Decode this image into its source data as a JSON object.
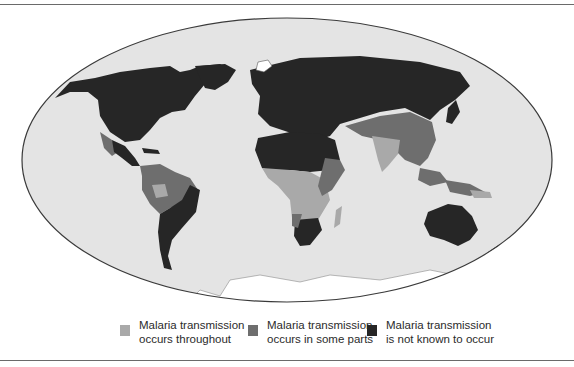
{
  "map": {
    "projection": "elliptical world map",
    "colors": {
      "ocean": "#e4e4e4",
      "throughout": "#a9a9a9",
      "some_parts": "#6e6e6e",
      "not_known": "#262626",
      "ice": "#ffffff",
      "outline": "#3a3a3a",
      "rule": "#6a6a6a"
    }
  },
  "legend": {
    "items": [
      {
        "line1": "Malaria transmission",
        "line2": "occurs throughout",
        "color": "#a9a9a9"
      },
      {
        "line1": "Malaria transmission",
        "line2": "occurs in some parts",
        "color": "#6e6e6e"
      },
      {
        "line1": "Malaria transmission",
        "line2": "is not known to occur",
        "color": "#262626"
      }
    ]
  }
}
